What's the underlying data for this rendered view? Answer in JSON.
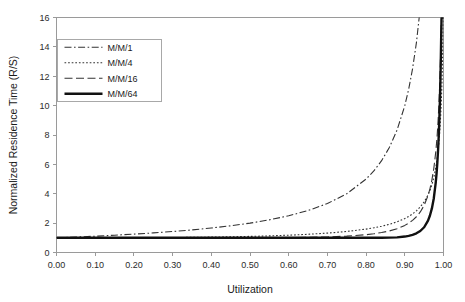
{
  "chart_data": {
    "type": "line",
    "title": "",
    "xlabel": "Utilization",
    "ylabel": "Normalized Residence Time (R/S)",
    "xlim": [
      0.0,
      1.0
    ],
    "ylim": [
      0,
      16
    ],
    "xticks": [
      "0.00",
      "0.10",
      "0.20",
      "0.30",
      "0.40",
      "0.50",
      "0.60",
      "0.70",
      "0.80",
      "0.90",
      "1.00"
    ],
    "xtick_values": [
      0.0,
      0.1,
      0.2,
      0.3,
      0.4,
      0.5,
      0.6,
      0.7,
      0.8,
      0.9,
      1.0
    ],
    "yticks": [
      "0",
      "2",
      "4",
      "6",
      "8",
      "10",
      "12",
      "14",
      "16"
    ],
    "ytick_values": [
      0,
      2,
      4,
      6,
      8,
      10,
      12,
      14,
      16
    ],
    "grid": false,
    "legend_position": "upper-left",
    "x": [
      0.0,
      0.05,
      0.1,
      0.15,
      0.2,
      0.25,
      0.3,
      0.35,
      0.4,
      0.45,
      0.5,
      0.55,
      0.6,
      0.65,
      0.7,
      0.75,
      0.8,
      0.82,
      0.84,
      0.86,
      0.88,
      0.9,
      0.91,
      0.92,
      0.93,
      0.94,
      0.95,
      0.96,
      0.965,
      0.97,
      0.975,
      0.98,
      0.982,
      0.984,
      0.986,
      0.988,
      0.99,
      0.991,
      0.992,
      0.993,
      0.994,
      0.995,
      0.996,
      0.997,
      0.998,
      0.999,
      1.0
    ],
    "series": [
      {
        "name": "M/M/1",
        "style": "dash-dot",
        "color": "#333333",
        "width": 1.1,
        "values": [
          1.0,
          1.053,
          1.111,
          1.176,
          1.25,
          1.333,
          1.429,
          1.538,
          1.667,
          1.818,
          2.0,
          2.222,
          2.5,
          2.857,
          3.333,
          4.0,
          5.0,
          5.556,
          6.25,
          7.143,
          8.333,
          10.0,
          11.111,
          12.5,
          14.286,
          16.667,
          20.0,
          25.0,
          28.571,
          33.333,
          40.0,
          50.0,
          55.556,
          62.5,
          71.429,
          83.333,
          100.0,
          111.1,
          125.0,
          142.9,
          166.7,
          200.0,
          250.0,
          333.3,
          500.0,
          1000.0,
          9999
        ]
      },
      {
        "name": "M/M/4",
        "style": "dotted",
        "color": "#333333",
        "width": 1.1,
        "values": [
          1.0,
          1.0,
          1.001,
          1.003,
          1.006,
          1.011,
          1.019,
          1.031,
          1.047,
          1.068,
          1.096,
          1.132,
          1.179,
          1.24,
          1.321,
          1.432,
          1.594,
          1.681,
          1.787,
          1.919,
          2.088,
          2.313,
          2.455,
          2.626,
          2.836,
          3.101,
          3.446,
          3.918,
          4.225,
          4.609,
          5.103,
          5.762,
          6.09,
          6.474,
          6.928,
          7.475,
          8.146,
          8.537,
          8.978,
          9.48,
          10.06,
          10.73,
          11.53,
          12.52,
          13.77,
          15.42,
          16.0
        ]
      },
      {
        "name": "M/M/16",
        "style": "long-dash",
        "color": "#333333",
        "width": 1.1,
        "values": [
          1.0,
          1.0,
          1.0,
          1.0,
          1.0,
          1.0,
          1.0,
          1.0,
          1.001,
          1.002,
          1.004,
          1.008,
          1.016,
          1.031,
          1.06,
          1.113,
          1.213,
          1.276,
          1.358,
          1.468,
          1.621,
          1.846,
          1.999,
          2.19,
          2.435,
          2.76,
          3.209,
          3.876,
          4.336,
          4.931,
          5.728,
          6.849,
          7.431,
          8.127,
          8.973,
          10.02,
          11.36,
          12.16,
          13.08,
          14.15,
          15.42,
          16.0,
          16.0,
          16.0,
          16.0,
          16.0,
          16.0
        ]
      },
      {
        "name": "M/M/64",
        "style": "solid-thick",
        "color": "#111111",
        "width": 2.4,
        "values": [
          1.0,
          1.0,
          1.0,
          1.0,
          1.0,
          1.0,
          1.0,
          1.0,
          1.0,
          1.0,
          1.0,
          1.0,
          1.0,
          1.0,
          1.0,
          1.0,
          1.001,
          1.002,
          1.005,
          1.012,
          1.031,
          1.085,
          1.133,
          1.203,
          1.306,
          1.464,
          1.72,
          2.171,
          2.518,
          3.0,
          3.7,
          4.78,
          5.36,
          6.08,
          6.98,
          8.14,
          9.68,
          10.63,
          11.74,
          13.06,
          14.65,
          16.0,
          16.0,
          16.0,
          16.0,
          16.0,
          16.0
        ]
      }
    ],
    "legend": [
      {
        "label": "M/M/1",
        "style": "dash-dot"
      },
      {
        "label": "M/M/4",
        "style": "dotted"
      },
      {
        "label": "M/M/16",
        "style": "long-dash"
      },
      {
        "label": "M/M/64",
        "style": "solid-thick"
      }
    ]
  }
}
